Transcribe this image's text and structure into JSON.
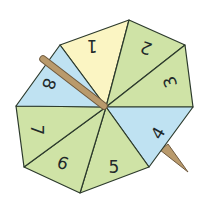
{
  "spinner": {
    "shape": "octagon",
    "sections": 8,
    "colors": {
      "yellow": "#fbf5c3",
      "blue": "#bfe2f2",
      "green": "#cfe3a6",
      "outline": "#2c3a2c",
      "stick": "#b99a6c",
      "stick_outline": "#6f5a3e"
    },
    "center": [
      106,
      107
    ],
    "vertices": [
      [
        129,
        20
      ],
      [
        185,
        45
      ],
      [
        193,
        107
      ],
      [
        149,
        167
      ],
      [
        80,
        193
      ],
      [
        24,
        167
      ],
      [
        16,
        106
      ],
      [
        60,
        45
      ]
    ],
    "segments": [
      {
        "label": "1",
        "color": "yellow",
        "tx": 92,
        "ty": 46,
        "rot": 180
      },
      {
        "label": "2",
        "color": "green",
        "tx": 148,
        "ty": 47,
        "rot": 200
      },
      {
        "label": "3",
        "color": "green",
        "tx": 170,
        "ty": 82,
        "rot": 250
      },
      {
        "label": "4",
        "color": "blue",
        "tx": 160,
        "ty": 133,
        "rot": 300
      },
      {
        "label": "5",
        "color": "green",
        "tx": 114,
        "ty": 168,
        "rot": 0
      },
      {
        "label": "6",
        "color": "green",
        "tx": 63,
        "ty": 163,
        "rot": 20
      },
      {
        "label": "7",
        "color": "green",
        "tx": 37,
        "ty": 130,
        "rot": 90
      },
      {
        "label": "8",
        "color": "blue",
        "tx": 48,
        "ty": 84,
        "rot": 110
      }
    ]
  }
}
